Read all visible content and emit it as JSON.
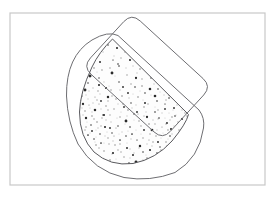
{
  "document": {
    "title": "Shape Overlap Diagram",
    "width": 276,
    "height": 198,
    "background_color": "#ffffff"
  },
  "frame": {
    "label": "drawing-frame",
    "x": 10,
    "y": 13,
    "width": 255,
    "height": 172,
    "stroke_color": "#c8c8c8",
    "stroke_width": 1.2,
    "fill_color": "#ffffff"
  },
  "shapes": [
    {
      "id": "rotated-rounded-rectangle",
      "label": "Rotated rounded rectangle",
      "type": "rounded-rectangle",
      "rotation_degrees": -42,
      "center_x": 161,
      "center_y": 73,
      "rect_width": 104,
      "rect_height": 84,
      "corner_radius": 12,
      "stroke_color": "#6e6e72",
      "stroke_width": 1.0,
      "fill_color": "none",
      "path": "M 140.2 21.0 L 203.0 78.5 Q 211.6 86.4 203.7 95.0 L 170.5 131.2 Q 162.6 139.8 154.0 131.9 L 91.2 74.4 Q 82.6 66.5 90.5 57.9 L 123.7 21.7 Q 131.6 13.1 140.2 21.0 Z"
    },
    {
      "id": "outer-bowl-outline",
      "label": "Outer rounded bowl outline",
      "type": "rounded-bowl",
      "stroke_color": "#6e6e72",
      "stroke_width": 1.0,
      "fill_color": "none",
      "path": "M 66.5 96.0 Q 66.0 56.0 92.0 40.0 Q 108.0 30.5 118.0 35.5 L 199.0 110.0 Q 205.0 118.0 203.5 128.0 Q 199.5 158.0 175.0 172.5 Q 150.0 182.0 124.0 177.5 Q 94.0 171.0 78.0 144.0 Q 67.5 122.0 66.5 96.0 Z"
    },
    {
      "id": "inner-speckled-region",
      "label": "Inner speckled intersection region",
      "type": "speckled-bowl",
      "stroke_color": "#5a5a5e",
      "stroke_width": 1.0,
      "fill_color": "#fdfdfd",
      "texture": "stipple",
      "path": "M 112.5 39.0 Q 99.0 52.0 92.0 67.0 Q 80.0 92.0 79.5 112.0 Q 79.5 137.0 94.0 152.0 Q 110.0 166.5 133.0 163.5 Q 156.0 159.0 172.0 141.0 Q 186.0 124.0 188.5 114.5 Z"
    }
  ],
  "texture": {
    "label": "stipple-texture",
    "dark_dot_color": "#2b2b2b",
    "mid_dot_color": "#8a8a8a",
    "light_dot_color": "#c9c9c9",
    "dark_dot_count": 62,
    "mid_dot_count": 86,
    "light_dot_count": 150,
    "dark_dots": [
      [
        117,
        48
      ],
      [
        142,
        47
      ],
      [
        166,
        55
      ],
      [
        100,
        62
      ],
      [
        130,
        60
      ],
      [
        152,
        66
      ],
      [
        176,
        63
      ],
      [
        90,
        76
      ],
      [
        112,
        73
      ],
      [
        136,
        78
      ],
      [
        158,
        74
      ],
      [
        179,
        80
      ],
      [
        85,
        90
      ],
      [
        106,
        88
      ],
      [
        128,
        93
      ],
      [
        150,
        89
      ],
      [
        170,
        95
      ],
      [
        188,
        92
      ],
      [
        83,
        104
      ],
      [
        101,
        101
      ],
      [
        124,
        107
      ],
      [
        145,
        103
      ],
      [
        165,
        109
      ],
      [
        183,
        105
      ],
      [
        86,
        118
      ],
      [
        104,
        115
      ],
      [
        126,
        121
      ],
      [
        147,
        117
      ],
      [
        167,
        123
      ],
      [
        182,
        119
      ],
      [
        92,
        131
      ],
      [
        110,
        128
      ],
      [
        132,
        134
      ],
      [
        152,
        130
      ],
      [
        170,
        136
      ],
      [
        101,
        143
      ],
      [
        120,
        140
      ],
      [
        140,
        146
      ],
      [
        158,
        142
      ],
      [
        113,
        153
      ],
      [
        133,
        155
      ],
      [
        150,
        150
      ],
      [
        96,
        55
      ],
      [
        123,
        87
      ],
      [
        159,
        118
      ],
      [
        137,
        112
      ],
      [
        108,
        97
      ],
      [
        174,
        108
      ],
      [
        95,
        110
      ],
      [
        144,
        130
      ],
      [
        119,
        66
      ],
      [
        155,
        96
      ],
      [
        180,
        70
      ],
      [
        88,
        135
      ],
      [
        127,
        148
      ],
      [
        163,
        86
      ],
      [
        105,
        127
      ],
      [
        146,
        59
      ],
      [
        171,
        129
      ],
      [
        99,
        85
      ],
      [
        136,
        162
      ],
      [
        153,
        162
      ]
    ],
    "mid_dots": [
      [
        108,
        45
      ],
      [
        125,
        52
      ],
      [
        148,
        53
      ],
      [
        162,
        48
      ],
      [
        94,
        68
      ],
      [
        118,
        64
      ],
      [
        140,
        69
      ],
      [
        161,
        60
      ],
      [
        178,
        72
      ],
      [
        88,
        83
      ],
      [
        99,
        78
      ],
      [
        119,
        82
      ],
      [
        142,
        86
      ],
      [
        163,
        82
      ],
      [
        184,
        86
      ],
      [
        82,
        96
      ],
      [
        95,
        97
      ],
      [
        116,
        99
      ],
      [
        138,
        97
      ],
      [
        157,
        101
      ],
      [
        177,
        99
      ],
      [
        85,
        111
      ],
      [
        97,
        122
      ],
      [
        114,
        109
      ],
      [
        134,
        114
      ],
      [
        155,
        112
      ],
      [
        175,
        116
      ],
      [
        190,
        110
      ],
      [
        91,
        125
      ],
      [
        112,
        133
      ],
      [
        130,
        127
      ],
      [
        149,
        124
      ],
      [
        168,
        130
      ],
      [
        186,
        124
      ],
      [
        94,
        139
      ],
      [
        115,
        145
      ],
      [
        137,
        140
      ],
      [
        156,
        136
      ],
      [
        175,
        142
      ],
      [
        104,
        151
      ],
      [
        124,
        157
      ],
      [
        143,
        152
      ],
      [
        160,
        147
      ],
      [
        110,
        160
      ],
      [
        129,
        163
      ],
      [
        147,
        158
      ],
      [
        102,
        70
      ],
      [
        133,
        55
      ],
      [
        170,
        70
      ],
      [
        86,
        127
      ],
      [
        120,
        117
      ],
      [
        158,
        89
      ],
      [
        181,
        96
      ],
      [
        98,
        91
      ],
      [
        127,
        75
      ],
      [
        151,
        78
      ],
      [
        172,
        117
      ],
      [
        92,
        116
      ],
      [
        106,
        106
      ],
      [
        144,
        107
      ],
      [
        165,
        104
      ],
      [
        187,
        116
      ],
      [
        89,
        105
      ],
      [
        111,
        90
      ],
      [
        131,
        103
      ],
      [
        153,
        142
      ],
      [
        118,
        126
      ],
      [
        139,
        121
      ],
      [
        162,
        127
      ],
      [
        100,
        134
      ],
      [
        122,
        96
      ],
      [
        143,
        138
      ],
      [
        166,
        142
      ],
      [
        108,
        138
      ],
      [
        128,
        110
      ],
      [
        148,
        167
      ],
      [
        117,
        167
      ],
      [
        96,
        145
      ],
      [
        135,
        87
      ],
      [
        157,
        153
      ],
      [
        179,
        130
      ],
      [
        113,
        60
      ],
      [
        145,
        93
      ],
      [
        103,
        115
      ],
      [
        126,
        136
      ],
      [
        169,
        98
      ]
    ],
    "light_dots": [
      [
        103,
        52
      ],
      [
        114,
        56
      ],
      [
        128,
        49
      ],
      [
        139,
        57
      ],
      [
        152,
        45
      ],
      [
        164,
        67
      ],
      [
        175,
        57
      ],
      [
        186,
        78
      ],
      [
        91,
        62
      ],
      [
        97,
        72
      ],
      [
        110,
        68
      ],
      [
        121,
        58
      ],
      [
        133,
        66
      ],
      [
        145,
        61
      ],
      [
        156,
        55
      ],
      [
        168,
        76
      ],
      [
        180,
        64
      ],
      [
        190,
        84
      ],
      [
        84,
        78
      ],
      [
        93,
        88
      ],
      [
        104,
        82
      ],
      [
        115,
        76
      ],
      [
        126,
        68
      ],
      [
        137,
        73
      ],
      [
        149,
        70
      ],
      [
        160,
        92
      ],
      [
        171,
        87
      ],
      [
        183,
        93
      ],
      [
        80,
        90
      ],
      [
        88,
        99
      ],
      [
        100,
        94
      ],
      [
        109,
        86
      ],
      [
        120,
        90
      ],
      [
        131,
        84
      ],
      [
        142,
        79
      ],
      [
        154,
        84
      ],
      [
        166,
        100
      ],
      [
        177,
        105
      ],
      [
        188,
        100
      ],
      [
        81,
        101
      ],
      [
        90,
        108
      ],
      [
        99,
        104
      ],
      [
        108,
        110
      ],
      [
        118,
        104
      ],
      [
        129,
        98
      ],
      [
        140,
        91
      ],
      [
        151,
        95
      ],
      [
        162,
        113
      ],
      [
        173,
        110
      ],
      [
        185,
        113
      ],
      [
        83,
        115
      ],
      [
        92,
        112
      ],
      [
        102,
        118
      ],
      [
        111,
        122
      ],
      [
        121,
        112
      ],
      [
        132,
        108
      ],
      [
        143,
        100
      ],
      [
        155,
        107
      ],
      [
        165,
        118
      ],
      [
        178,
        122
      ],
      [
        189,
        118
      ],
      [
        87,
        122
      ],
      [
        96,
        130
      ],
      [
        106,
        120
      ],
      [
        117,
        118
      ],
      [
        127,
        116
      ],
      [
        136,
        105
      ],
      [
        146,
        112
      ],
      [
        158,
        119
      ],
      [
        169,
        113
      ],
      [
        180,
        134
      ],
      [
        90,
        133
      ],
      [
        98,
        128
      ],
      [
        107,
        132
      ],
      [
        116,
        128
      ],
      [
        125,
        124
      ],
      [
        134,
        120
      ],
      [
        144,
        116
      ],
      [
        153,
        120
      ],
      [
        163,
        133
      ],
      [
        174,
        126
      ],
      [
        95,
        142
      ],
      [
        105,
        136
      ],
      [
        113,
        141
      ],
      [
        122,
        132
      ],
      [
        131,
        139
      ],
      [
        141,
        126
      ],
      [
        150,
        134
      ],
      [
        161,
        138
      ],
      [
        172,
        134
      ],
      [
        184,
        128
      ],
      [
        99,
        148
      ],
      [
        109,
        144
      ],
      [
        118,
        150
      ],
      [
        127,
        143
      ],
      [
        136,
        130
      ],
      [
        147,
        144
      ],
      [
        157,
        130
      ],
      [
        167,
        146
      ],
      [
        177,
        137
      ],
      [
        103,
        158
      ],
      [
        112,
        154
      ],
      [
        121,
        152
      ],
      [
        130,
        158
      ],
      [
        139,
        148
      ],
      [
        149,
        140
      ],
      [
        159,
        158
      ],
      [
        168,
        139
      ],
      [
        107,
        164
      ],
      [
        116,
        159
      ],
      [
        125,
        166
      ],
      [
        134,
        153
      ],
      [
        143,
        160
      ],
      [
        152,
        146
      ],
      [
        161,
        150
      ],
      [
        86,
        95
      ],
      [
        94,
        119
      ],
      [
        101,
        109
      ],
      [
        112,
        96
      ],
      [
        123,
        104
      ],
      [
        133,
        94
      ],
      [
        141,
        134
      ],
      [
        152,
        160
      ],
      [
        164,
        95
      ],
      [
        175,
        99
      ],
      [
        187,
        106
      ],
      [
        82,
        108
      ],
      [
        89,
        91
      ],
      [
        97,
        100
      ],
      [
        108,
        101
      ],
      [
        119,
        134
      ],
      [
        130,
        149
      ],
      [
        139,
        164
      ],
      [
        146,
        155
      ],
      [
        155,
        124
      ],
      [
        166,
        124
      ],
      [
        176,
        115
      ],
      [
        93,
        103
      ],
      [
        101,
        126
      ],
      [
        110,
        115
      ],
      [
        120,
        144
      ],
      [
        128,
        131
      ],
      [
        138,
        114
      ],
      [
        148,
        104
      ],
      [
        158,
        110
      ],
      [
        170,
        120
      ],
      [
        182,
        110
      ],
      [
        85,
        130
      ],
      [
        96,
        137
      ],
      [
        104,
        143
      ],
      [
        114,
        136
      ]
    ]
  },
  "annotations": {
    "visible_text": []
  }
}
